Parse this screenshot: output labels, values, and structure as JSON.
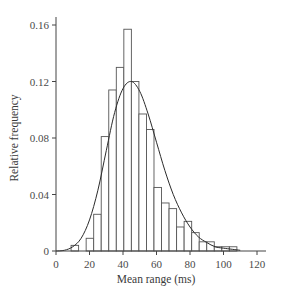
{
  "chart_data": {
    "type": "bar",
    "subtype": "histogram_with_fitted_curve",
    "title": "",
    "xlabel": "Mean range (ms)",
    "ylabel": "Relative frequency",
    "xlim": [
      0,
      120
    ],
    "ylim": [
      0,
      0.16
    ],
    "xticks": [
      0,
      20,
      40,
      60,
      80,
      100,
      120
    ],
    "xtick_labels": [
      "0",
      "20",
      "40",
      "60",
      "80",
      "100",
      "120"
    ],
    "yticks": [
      0,
      0.04,
      0.08,
      0.12,
      0.16
    ],
    "ytick_labels": [
      "0",
      "0.04",
      "0.08",
      "0.12",
      "0.16"
    ],
    "grid": false,
    "legend": null,
    "bin_width": 4.5,
    "bins": [
      {
        "start": 9.0,
        "end": 13.5,
        "value": 0.004
      },
      {
        "start": 13.5,
        "end": 18.0,
        "value": 0.0
      },
      {
        "start": 18.0,
        "end": 22.5,
        "value": 0.009
      },
      {
        "start": 22.5,
        "end": 27.0,
        "value": 0.026
      },
      {
        "start": 27.0,
        "end": 31.5,
        "value": 0.081
      },
      {
        "start": 31.5,
        "end": 36.0,
        "value": 0.114
      },
      {
        "start": 36.0,
        "end": 40.5,
        "value": 0.13
      },
      {
        "start": 40.5,
        "end": 45.0,
        "value": 0.157
      },
      {
        "start": 45.0,
        "end": 49.5,
        "value": 0.12
      },
      {
        "start": 49.5,
        "end": 54.0,
        "value": 0.097
      },
      {
        "start": 54.0,
        "end": 58.5,
        "value": 0.086
      },
      {
        "start": 58.5,
        "end": 63.0,
        "value": 0.045
      },
      {
        "start": 63.0,
        "end": 67.5,
        "value": 0.034
      },
      {
        "start": 67.5,
        "end": 72.0,
        "value": 0.03
      },
      {
        "start": 72.0,
        "end": 76.5,
        "value": 0.017
      },
      {
        "start": 76.5,
        "end": 81.0,
        "value": 0.021
      },
      {
        "start": 81.0,
        "end": 85.5,
        "value": 0.013
      },
      {
        "start": 85.5,
        "end": 90.0,
        "value": 0.0065
      },
      {
        "start": 90.0,
        "end": 94.5,
        "value": 0.0065
      },
      {
        "start": 94.5,
        "end": 99.0,
        "value": 0.003
      },
      {
        "start": 99.0,
        "end": 103.5,
        "value": 0.003
      },
      {
        "start": 103.5,
        "end": 108.0,
        "value": 0.003
      }
    ],
    "series": [
      {
        "name": "fitted density curve",
        "type": "line",
        "x": [
          0,
          5,
          10,
          15,
          20,
          25,
          30,
          35,
          40,
          45,
          50,
          55,
          60,
          65,
          70,
          75,
          80,
          85,
          90,
          95,
          100,
          110
        ],
        "values": [
          0.0,
          0.0005,
          0.003,
          0.009,
          0.022,
          0.043,
          0.071,
          0.098,
          0.115,
          0.12,
          0.113,
          0.097,
          0.077,
          0.057,
          0.04,
          0.027,
          0.017,
          0.01,
          0.006,
          0.003,
          0.002,
          0.0005
        ]
      }
    ],
    "curve_peak": {
      "x": 45.5,
      "y": 0.12
    }
  }
}
